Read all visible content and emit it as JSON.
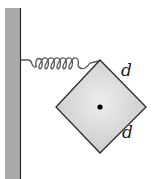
{
  "diagram": {
    "labels": {
      "side_upper_right": "d",
      "side_lower_right": "d"
    },
    "colors": {
      "wall_fill": "#a9a9a9",
      "wall_edge": "#2b2b2b",
      "spring": "#555555",
      "block_fill": "#d6d6d6",
      "block_edge": "#2b2b2b",
      "center_dot": "#000000"
    },
    "elements": [
      "wall",
      "spring",
      "square-block",
      "center-of-mass-dot"
    ]
  }
}
